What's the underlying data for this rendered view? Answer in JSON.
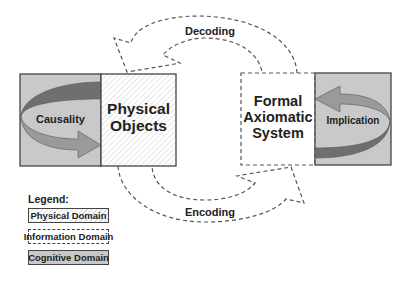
{
  "diagram": {
    "nodes": {
      "causality": {
        "label": "Causality",
        "domain": "Cognitive Domain"
      },
      "physical_objects": {
        "line1": "Physical",
        "line2": "Objects",
        "domain": "Physical Domain"
      },
      "formal_system": {
        "line1": "Formal",
        "line2": "Axiomatic",
        "line3": "System",
        "domain": "Information Domain"
      },
      "implication": {
        "label": "Implication",
        "domain": "Cognitive Domain"
      }
    },
    "edges": {
      "decoding": {
        "label": "Decoding",
        "from": "Formal Axiomatic System",
        "to": "Physical Objects"
      },
      "encoding": {
        "label": "Encoding",
        "from": "Physical Objects",
        "to": "Formal Axiomatic System"
      }
    },
    "legend": {
      "title": "Legend:",
      "items": [
        {
          "label": "Physical Domain",
          "style": "hatched"
        },
        {
          "label": "Information Domain",
          "style": "dashed"
        },
        {
          "label": "Cognitive Domain",
          "style": "gray"
        }
      ]
    },
    "colors": {
      "cognitive_fill": "#c8c8c8",
      "arrow_dark": "#6e6e6e",
      "arrow_light": "#9a9a9a",
      "stroke": "#444444"
    }
  }
}
